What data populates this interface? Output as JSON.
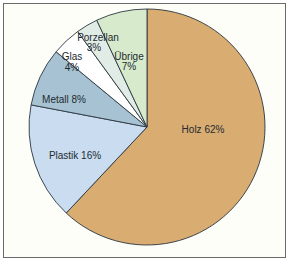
{
  "chart_data": {
    "type": "pie",
    "title": "",
    "start_angle_deg": 0,
    "direction": "clockwise",
    "slices": [
      {
        "label": "Holz",
        "value": 62,
        "display": "Holz 62%",
        "color": "#d9ad72"
      },
      {
        "label": "Plastik",
        "value": 16,
        "display": "Plastik 16%",
        "color": "#c9dcf0"
      },
      {
        "label": "Metall",
        "value": 8,
        "display": "Metall 8%",
        "color": "#a7c3d3"
      },
      {
        "label": "Glas",
        "value": 4,
        "display": "Glas 4%",
        "color": "#ffffff"
      },
      {
        "label": "Porzellan",
        "value": 3,
        "display": "Porzellan 3%",
        "color": "#e1ece6"
      },
      {
        "label": "Übrige",
        "value": 7,
        "display": "Übrige 7%",
        "color": "#d7ebcc"
      }
    ],
    "legend": "none (labels inside slices)",
    "grid": false
  },
  "labels": {
    "holz": "Holz 62%",
    "plastik": "Plastik 16%",
    "metall": "Metall 8%",
    "glas_name": "Glas",
    "glas_value": "4%",
    "porzellan_name": "Porzellan",
    "porzellan_value": "3%",
    "uebrige_name": "Übrige",
    "uebrige_value": "7%"
  },
  "colors": {
    "frame_border": "#6a6a6a",
    "frame_bg": "#fefef8",
    "slice_outline": "#2a3540",
    "label_text": "#1e2a30"
  }
}
